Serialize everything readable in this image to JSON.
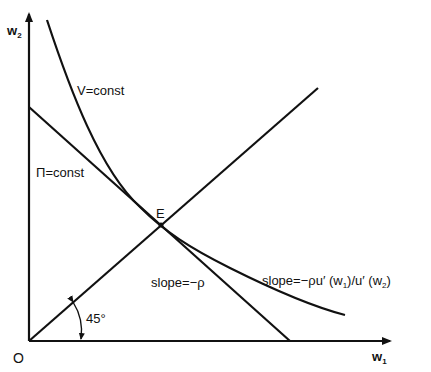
{
  "diagram": {
    "type": "economics-indifference",
    "colors": {
      "ink": "#111111",
      "background": "#ffffff"
    },
    "axes": {
      "origin_label": "O",
      "x_label": "w",
      "x_sub": "1",
      "y_label": "w",
      "y_sub": "2"
    },
    "curves": {
      "v_curve_label": "V=const",
      "pi_line_label": "Π=const",
      "ray_angle_label": "45°"
    },
    "point": {
      "label": "E"
    },
    "annotations": {
      "slope_pi": "slope=−ρ",
      "slope_v_prefix": "slope=−ρu′ (w",
      "slope_v_sub1": "1",
      "slope_v_mid": ")/u′ (w",
      "slope_v_sub2": "2",
      "slope_v_suffix": ")"
    }
  }
}
